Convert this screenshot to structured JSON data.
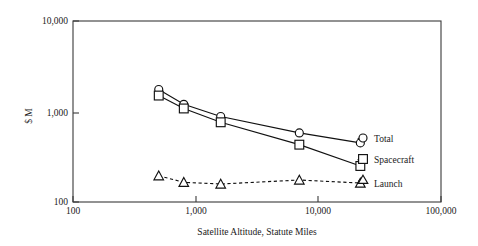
{
  "chart_data": {
    "type": "line",
    "title": "",
    "xlabel": "Satellite Altitude, Statute Miles",
    "ylabel": "$ M",
    "xscale": "log",
    "yscale": "log",
    "xlim": [
      100,
      100000
    ],
    "ylim": [
      100,
      10000
    ],
    "xticks": [
      100,
      1000,
      10000,
      100000
    ],
    "xticklabels": [
      "100",
      "1,000",
      "10,000",
      "100,000"
    ],
    "yticks": [
      100,
      1000,
      10000
    ],
    "yticklabels": [
      "100",
      "1,000",
      "10,000"
    ],
    "grid": false,
    "legend_position": "right-inside-labels",
    "series": [
      {
        "name": "Total",
        "marker": "circle",
        "linestyle": "solid",
        "x": [
          500,
          800,
          1600,
          7000,
          22000
        ],
        "y": [
          1750,
          1200,
          880,
          580,
          450
        ]
      },
      {
        "name": "Spacecraft",
        "marker": "square",
        "linestyle": "solid",
        "x": [
          500,
          800,
          1600,
          7000,
          22000
        ],
        "y": [
          1500,
          1080,
          760,
          430,
          250
        ]
      },
      {
        "name": "Launch",
        "marker": "triangle",
        "linestyle": "dashed",
        "x": [
          500,
          800,
          1600,
          7000,
          22000
        ],
        "y": [
          195,
          165,
          158,
          175,
          162
        ]
      }
    ]
  },
  "axes": {
    "x_title": "Satellite Altitude, Statute Miles",
    "y_title": "$ M",
    "x_tick_labels": [
      "100",
      "1,000",
      "10,000",
      "100,000"
    ],
    "y_tick_labels": [
      "10,000",
      "1,000",
      "100"
    ]
  },
  "legend": {
    "items": [
      {
        "label": "Total",
        "marker": "circle-marker"
      },
      {
        "label": "Spacecraft",
        "marker": "square-marker"
      },
      {
        "label": "Launch",
        "marker": "triangle-marker"
      }
    ]
  },
  "colors": {
    "line": "#111111",
    "frame": "#3a3a3a",
    "marker_fill": "#ffffff",
    "background": "#ffffff"
  }
}
